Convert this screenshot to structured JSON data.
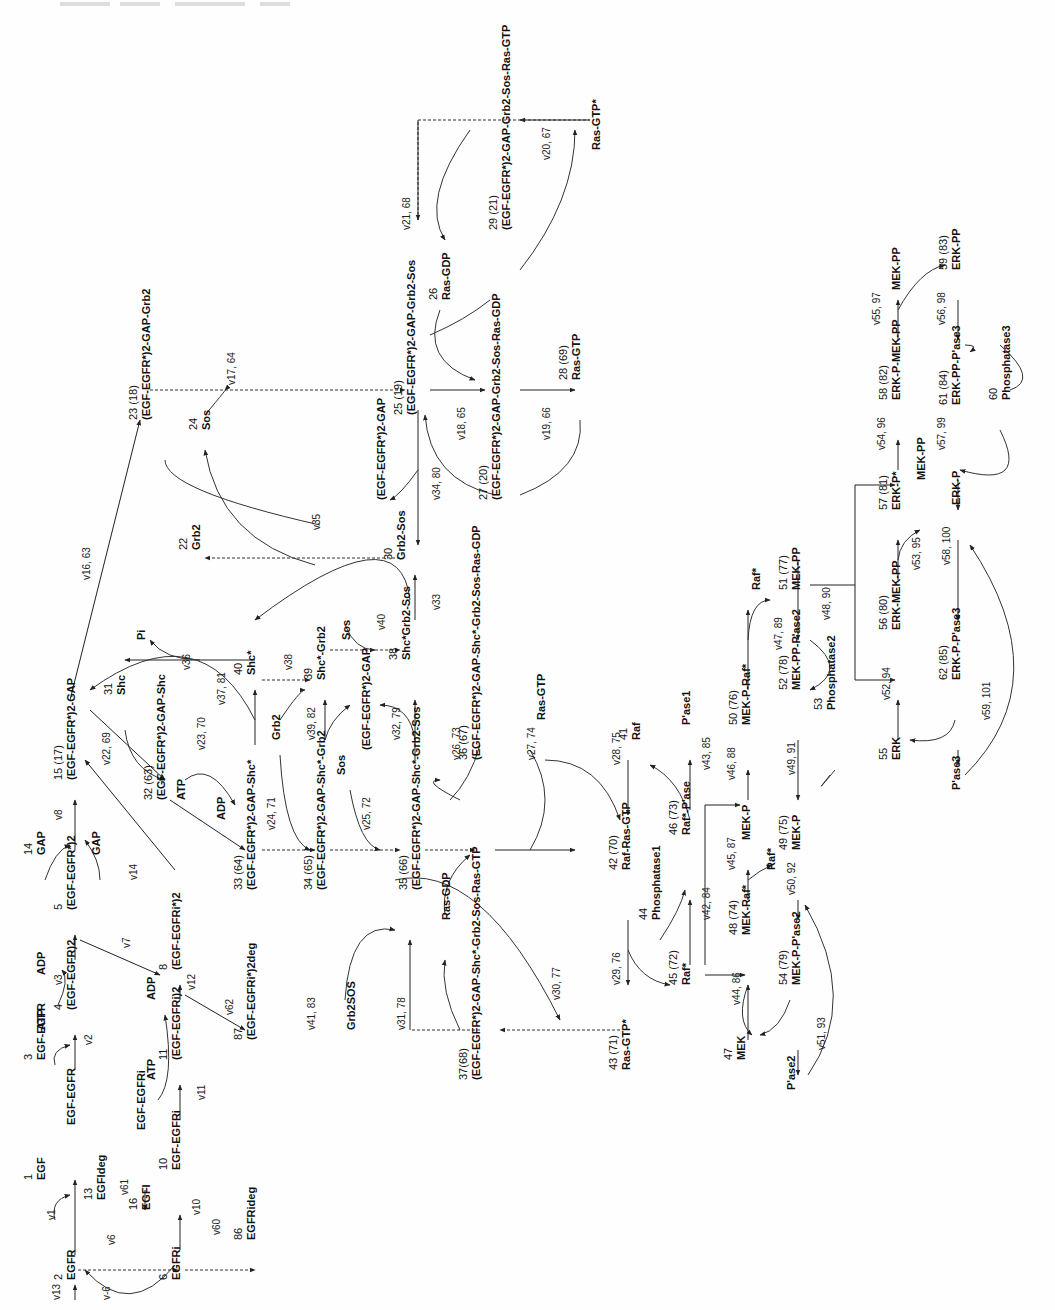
{
  "figure": {
    "orientation": "rotated 90° counter-clockwise"
  },
  "species": [
    {
      "id": "n2",
      "text": "EGFR",
      "num": "2",
      "x": 75,
      "y": 1280
    },
    {
      "id": "n1",
      "text": "EGF",
      "num": "1",
      "x": 45,
      "y": 1180
    },
    {
      "id": "n1b",
      "text": "EGF-EGFR",
      "num": "",
      "x": 75,
      "y": 1125
    },
    {
      "id": "n3",
      "text": "EGF-EGFR",
      "num": "3",
      "x": 45,
      "y": 1060
    },
    {
      "id": "n4",
      "text": "(EGF-EGFR)2",
      "num": "4",
      "x": 75,
      "y": 1010
    },
    {
      "id": "n5",
      "text": "(EGF-EGFR*)2",
      "num": "5",
      "x": 75,
      "y": 910
    },
    {
      "id": "n14",
      "text": "GAP",
      "num": "14",
      "x": 45,
      "y": 855
    },
    {
      "id": "n15",
      "text": "(EGF-EGFR*)2-GAP",
      "num": "15 (17)",
      "x": 75,
      "y": 780
    },
    {
      "id": "gap",
      "text": "GAP",
      "num": "",
      "x": 100,
      "y": 855
    },
    {
      "id": "atp1",
      "text": "ATP",
      "num": "",
      "x": 45,
      "y": 1030
    },
    {
      "id": "adp1",
      "text": "ADP",
      "num": "",
      "x": 45,
      "y": 975
    },
    {
      "id": "egfideg",
      "text": "EGFIdeg",
      "num": "13",
      "x": 105,
      "y": 1200
    },
    {
      "id": "egfi",
      "text": "EGFI",
      "num": "16",
      "x": 150,
      "y": 1210
    },
    {
      "id": "n6",
      "text": "EGFRi",
      "num": "6",
      "x": 180,
      "y": 1280
    },
    {
      "id": "n10",
      "text": "EGF-EGFRi",
      "num": "10",
      "x": 180,
      "y": 1170
    },
    {
      "id": "egfegfri",
      "text": "EGF-EGFRi",
      "num": "",
      "x": 145,
      "y": 1130
    },
    {
      "id": "n11",
      "text": "(EGF-EGFRi)2",
      "num": "11",
      "x": 180,
      "y": 1060
    },
    {
      "id": "atp2",
      "text": "ATP",
      "num": "",
      "x": 155,
      "y": 1080
    },
    {
      "id": "adp2",
      "text": "ADP",
      "num": "",
      "x": 155,
      "y": 1000
    },
    {
      "id": "n8",
      "text": "(EGF-EGFRi*)2",
      "num": "8",
      "x": 180,
      "y": 970
    },
    {
      "id": "n86",
      "text": "EGFRideg",
      "num": "86",
      "x": 255,
      "y": 1240
    },
    {
      "id": "n87",
      "text": "(EGF-EGFRi*)2deg",
      "num": "87",
      "x": 255,
      "y": 1040
    },
    {
      "id": "n22",
      "text": "Grb2",
      "num": "22",
      "x": 200,
      "y": 550
    },
    {
      "id": "n23",
      "text": "(EGF-EGFR*)2-GAP-Grb2",
      "num": "23 (18)",
      "x": 150,
      "y": 420
    },
    {
      "id": "n24",
      "text": "Sos",
      "num": "24",
      "x": 210,
      "y": 430
    },
    {
      "id": "n25",
      "text": "(EGF-EGFR*)2-GAP-Grb2-Sos",
      "num": "25 (19)",
      "x": 415,
      "y": 415
    },
    {
      "id": "gapcplx",
      "text": "(EGF-EGFR*)2-GAP",
      "num": "",
      "x": 385,
      "y": 500
    },
    {
      "id": "n26",
      "text": "Ras-GDP",
      "num": "26",
      "x": 450,
      "y": 300
    },
    {
      "id": "n29",
      "text": "(EGF-EGFR*)2-GAP-Grb2-Sos-Ras-GTP",
      "num": "29 (21)",
      "x": 510,
      "y": 230
    },
    {
      "id": "rasgtpstar1",
      "text": "Ras-GTP*",
      "num": "",
      "x": 600,
      "y": 150
    },
    {
      "id": "n27",
      "text": "(EGF-EGFR*)2-GAP-Grb2-Sos-Ras-GDP",
      "num": "27 (20)",
      "x": 500,
      "y": 500
    },
    {
      "id": "n28",
      "text": "Ras-GTP",
      "num": "28 (69)",
      "x": 580,
      "y": 380
    },
    {
      "id": "n30",
      "text": "Grb2-Sos",
      "num": "30",
      "x": 405,
      "y": 560
    },
    {
      "id": "n31",
      "text": "Shc",
      "num": "31",
      "x": 125,
      "y": 695
    },
    {
      "id": "pi",
      "text": "Pi",
      "num": "",
      "x": 145,
      "y": 640
    },
    {
      "id": "n32",
      "text": "(EGF-EGFR*)2-GAP-Shc",
      "num": "32 (63)",
      "x": 165,
      "y": 800
    },
    {
      "id": "atp3",
      "text": "ATP",
      "num": "",
      "x": 185,
      "y": 800
    },
    {
      "id": "adp3",
      "text": "ADP",
      "num": "",
      "x": 225,
      "y": 820
    },
    {
      "id": "n33",
      "text": "(EGF-EGFR*)2-GAP-Shc*",
      "num": "33 (64)",
      "x": 255,
      "y": 890
    },
    {
      "id": "n40",
      "text": "Shc*",
      "num": "40",
      "x": 255,
      "y": 675
    },
    {
      "id": "grb2b",
      "text": "Grb2",
      "num": "",
      "x": 280,
      "y": 740
    },
    {
      "id": "n39",
      "text": "Shc*-Grb2",
      "num": "39",
      "x": 325,
      "y": 680
    },
    {
      "id": "n34",
      "text": "(EGF-EGFR*)2-GAP-Shc*-Grb2",
      "num": "34 (65)",
      "x": 325,
      "y": 890
    },
    {
      "id": "sos2",
      "text": "Sos",
      "num": "",
      "x": 350,
      "y": 640
    },
    {
      "id": "sos3",
      "text": "Sos",
      "num": "",
      "x": 345,
      "y": 775
    },
    {
      "id": "gapcplx2",
      "text": "(EGF-EGFR*)2-GAP",
      "num": "",
      "x": 370,
      "y": 750
    },
    {
      "id": "n38",
      "text": "Shc*Grb2-Sos",
      "num": "38",
      "x": 410,
      "y": 660
    },
    {
      "id": "n35",
      "text": "(EGF-EGFR*)2-GAP-Shc*-Grb2-Sos",
      "num": "35 (66)",
      "x": 420,
      "y": 890
    },
    {
      "id": "n36",
      "text": "(EGF-EGFR*)2-GAP-Shc*-Grb2-Sos-Ras-GDP",
      "num": "36 (67)",
      "x": 480,
      "y": 760
    },
    {
      "id": "rasgdp2",
      "text": "Ras-GDP",
      "num": "",
      "x": 450,
      "y": 920
    },
    {
      "id": "grb2sos",
      "text": "Grb2SOS",
      "num": "",
      "x": 355,
      "y": 1030
    },
    {
      "id": "n37",
      "text": "(EGF-EGFR*)2-GAP-Shc*-Grb2-Sos-Ras-GTP",
      "num": "37(68)",
      "x": 480,
      "y": 1080
    },
    {
      "id": "rasgtp2",
      "text": "Ras-GTP",
      "num": "",
      "x": 545,
      "y": 720
    },
    {
      "id": "n41",
      "text": "Raf",
      "num": "41",
      "x": 640,
      "y": 740
    },
    {
      "id": "n42",
      "text": "Raf-Ras-GTP",
      "num": "42 (70)",
      "x": 630,
      "y": 870
    },
    {
      "id": "n43",
      "text": "Ras-GTP*",
      "num": "43 (71)",
      "x": 630,
      "y": 1070
    },
    {
      "id": "n44",
      "text": "Phosphatase1",
      "num": "44",
      "x": 660,
      "y": 920
    },
    {
      "id": "n45",
      "text": "Raf*",
      "num": "45 (72)",
      "x": 690,
      "y": 985
    },
    {
      "id": "n46",
      "text": "Raf*-P'ase",
      "num": "46 (73)",
      "x": 690,
      "y": 835
    },
    {
      "id": "pase1",
      "text": "P'ase1",
      "num": "",
      "x": 690,
      "y": 725
    },
    {
      "id": "n47",
      "text": "MEK",
      "num": "47",
      "x": 745,
      "y": 1060
    },
    {
      "id": "n48",
      "text": "MEK-Raf*",
      "num": "48 (74)",
      "x": 750,
      "y": 935
    },
    {
      "id": "mekp1",
      "text": "MEK-P",
      "num": "",
      "x": 750,
      "y": 840
    },
    {
      "id": "n50",
      "text": "MEK-P-Raf*",
      "num": "50 (76)",
      "x": 750,
      "y": 725
    },
    {
      "id": "raf2",
      "text": "Raf*",
      "num": "",
      "x": 775,
      "y": 870
    },
    {
      "id": "n54",
      "text": "MEK-P-P'ase2",
      "num": "54 (79)",
      "x": 800,
      "y": 985
    },
    {
      "id": "n49",
      "text": "MEK-P",
      "num": "49 (75)",
      "x": 800,
      "y": 850
    },
    {
      "id": "n52",
      "text": "MEK-PP-P'ase2",
      "num": "52 (78)",
      "x": 800,
      "y": 690
    },
    {
      "id": "n53",
      "text": "Phosphatase2",
      "num": "53",
      "x": 835,
      "y": 710
    },
    {
      "id": "pase2",
      "text": "P'ase2",
      "num": "",
      "x": 795,
      "y": 1090
    },
    {
      "id": "raf3",
      "text": "Raf*",
      "num": "",
      "x": 760,
      "y": 590
    },
    {
      "id": "n51",
      "text": "MEK-PP",
      "num": "51 (77)",
      "x": 800,
      "y": 590
    },
    {
      "id": "n55",
      "text": "ERK",
      "num": "55",
      "x": 900,
      "y": 760
    },
    {
      "id": "n56",
      "text": "ERK-MEK-PP",
      "num": "56 (80)",
      "x": 900,
      "y": 630
    },
    {
      "id": "n57",
      "text": "ERK-P*",
      "num": "57 (81)",
      "x": 900,
      "y": 510
    },
    {
      "id": "mekpp2",
      "text": "MEK-PP",
      "num": "",
      "x": 925,
      "y": 480
    },
    {
      "id": "n62",
      "text": "ERK-P-P'ase3",
      "num": "62 (85)",
      "x": 960,
      "y": 680
    },
    {
      "id": "pase3",
      "text": "P'ase3",
      "num": "",
      "x": 960,
      "y": 790
    },
    {
      "id": "erkp",
      "text": "ERK-P",
      "num": "",
      "x": 960,
      "y": 505
    },
    {
      "id": "n58",
      "text": "ERK-P-MEK-PP",
      "num": "58 (82)",
      "x": 900,
      "y": 400
    },
    {
      "id": "n61",
      "text": "ERK-PP-P'ase3",
      "num": "61 (84)",
      "x": 960,
      "y": 405
    },
    {
      "id": "n60",
      "text": "Phosphatase3",
      "num": "60",
      "x": 1010,
      "y": 400
    },
    {
      "id": "mekpp3",
      "text": "MEK-PP",
      "num": "",
      "x": 900,
      "y": 290
    },
    {
      "id": "n59",
      "text": "ERK-PP",
      "num": "59 (83)",
      "x": 960,
      "y": 270
    }
  ],
  "reactions": [
    {
      "id": "v13",
      "label": "v13",
      "x": 60,
      "y": 1300
    },
    {
      "id": "v-6",
      "label": "v-6",
      "x": 110,
      "y": 1300
    },
    {
      "id": "v1",
      "label": "v1",
      "x": 55,
      "y": 1220
    },
    {
      "id": "v6",
      "label": "v6",
      "x": 115,
      "y": 1245
    },
    {
      "id": "v61",
      "label": "v61",
      "x": 128,
      "y": 1195
    },
    {
      "id": "v2",
      "label": "v2",
      "x": 92,
      "y": 1045
    },
    {
      "id": "v3",
      "label": "v3",
      "x": 62,
      "y": 985
    },
    {
      "id": "v7",
      "label": "v7",
      "x": 130,
      "y": 948
    },
    {
      "id": "v8",
      "label": "v8",
      "x": 62,
      "y": 820
    },
    {
      "id": "v14",
      "label": "v14",
      "x": 137,
      "y": 880
    },
    {
      "id": "v22",
      "label": "v22, 69",
      "x": 110,
      "y": 765
    },
    {
      "id": "v16",
      "label": "v16, 63",
      "x": 90,
      "y": 580
    },
    {
      "id": "v10",
      "label": "v10",
      "x": 200,
      "y": 1215
    },
    {
      "id": "v60",
      "label": "v60",
      "x": 220,
      "y": 1235
    },
    {
      "id": "v11",
      "label": "v11",
      "x": 205,
      "y": 1100
    },
    {
      "id": "v12",
      "label": "v12",
      "x": 195,
      "y": 990
    },
    {
      "id": "v62",
      "label": "v62",
      "x": 233,
      "y": 1015
    },
    {
      "id": "v23",
      "label": "v23, 70",
      "x": 205,
      "y": 750
    },
    {
      "id": "v24",
      "label": "v24, 71",
      "x": 275,
      "y": 830
    },
    {
      "id": "v36",
      "label": "v36",
      "x": 190,
      "y": 670
    },
    {
      "id": "v37",
      "label": "v37, 81",
      "x": 225,
      "y": 705
    },
    {
      "id": "v38",
      "label": "v38",
      "x": 292,
      "y": 670
    },
    {
      "id": "v39",
      "label": "v39, 82",
      "x": 315,
      "y": 740
    },
    {
      "id": "v25",
      "label": "v25, 72",
      "x": 370,
      "y": 830
    },
    {
      "id": "v32",
      "label": "v32, 79",
      "x": 400,
      "y": 740
    },
    {
      "id": "v40",
      "label": "v40",
      "x": 385,
      "y": 630
    },
    {
      "id": "v33",
      "label": "v33",
      "x": 440,
      "y": 610
    },
    {
      "id": "v35",
      "label": "v35",
      "x": 320,
      "y": 530
    },
    {
      "id": "v17",
      "label": "v17, 64",
      "x": 235,
      "y": 385
    },
    {
      "id": "v34",
      "label": "v34, 80",
      "x": 440,
      "y": 500
    },
    {
      "id": "v18",
      "label": "v18, 65",
      "x": 465,
      "y": 440
    },
    {
      "id": "v19",
      "label": "v19, 66",
      "x": 550,
      "y": 440
    },
    {
      "id": "v21",
      "label": "v21, 68",
      "x": 410,
      "y": 230
    },
    {
      "id": "v20",
      "label": "v20, 67",
      "x": 550,
      "y": 160
    },
    {
      "id": "v26",
      "label": "v26, 73",
      "x": 460,
      "y": 760
    },
    {
      "id": "v27",
      "label": "v27, 74",
      "x": 535,
      "y": 760
    },
    {
      "id": "v41",
      "label": "v41, 83",
      "x": 315,
      "y": 1030
    },
    {
      "id": "v31",
      "label": "v31, 78",
      "x": 405,
      "y": 1030
    },
    {
      "id": "v30",
      "label": "v30, 77",
      "x": 560,
      "y": 1000
    },
    {
      "id": "v29",
      "label": "v29, 76",
      "x": 620,
      "y": 985
    },
    {
      "id": "v28",
      "label": "v28, 75",
      "x": 620,
      "y": 765
    },
    {
      "id": "v42",
      "label": "v42, 84",
      "x": 710,
      "y": 920
    },
    {
      "id": "v43",
      "label": "v43, 85",
      "x": 710,
      "y": 770
    },
    {
      "id": "v44",
      "label": "v44, 86",
      "x": 740,
      "y": 1005
    },
    {
      "id": "v45",
      "label": "v45, 87",
      "x": 735,
      "y": 870
    },
    {
      "id": "v46",
      "label": "v46, 88",
      "x": 735,
      "y": 780
    },
    {
      "id": "v47",
      "label": "v47, 89",
      "x": 782,
      "y": 650
    },
    {
      "id": "v48",
      "label": "v48, 90",
      "x": 830,
      "y": 620
    },
    {
      "id": "v49",
      "label": "v49, 91",
      "x": 795,
      "y": 775
    },
    {
      "id": "v50",
      "label": "v50, 92",
      "x": 795,
      "y": 895
    },
    {
      "id": "v51",
      "label": "v51, 93",
      "x": 825,
      "y": 1050
    },
    {
      "id": "v52",
      "label": "v52, 94",
      "x": 890,
      "y": 700
    },
    {
      "id": "v53",
      "label": "v53, 95",
      "x": 920,
      "y": 570
    },
    {
      "id": "v54",
      "label": "v54, 96",
      "x": 885,
      "y": 450
    },
    {
      "id": "v55",
      "label": "v55, 97",
      "x": 880,
      "y": 325
    },
    {
      "id": "v56",
      "label": "v56, 98",
      "x": 945,
      "y": 325
    },
    {
      "id": "v57",
      "label": "v57, 99",
      "x": 945,
      "y": 450
    },
    {
      "id": "v58",
      "label": "v58, 100",
      "x": 950,
      "y": 565
    },
    {
      "id": "v59",
      "label": "v59, 101",
      "x": 990,
      "y": 720
    }
  ]
}
